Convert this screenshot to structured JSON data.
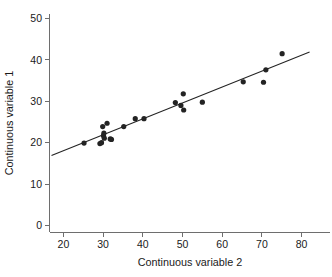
{
  "chart_data": {
    "type": "scatter",
    "title": "",
    "subtitle": "",
    "xlabel": "Continuous variable 2",
    "ylabel": "Continuous variable 1",
    "xlim": [
      16.5,
      82.5
    ],
    "ylim": [
      -1.5,
      53.0
    ],
    "xticks": [
      20,
      30,
      40,
      50,
      60,
      70,
      80
    ],
    "xticklabels": [
      "20",
      "30",
      "40",
      "50",
      "60",
      "70",
      "80"
    ],
    "yticks": [
      0,
      10,
      20,
      30,
      40,
      50
    ],
    "yticklabels": [
      "0",
      "10",
      "20",
      "30",
      "40",
      "50"
    ],
    "grid": false,
    "legend": null,
    "legend_position": "none",
    "marker": "filled-circle",
    "marker_color": "#232323",
    "marker_size": 2.6,
    "points": [
      {
        "x": 25.2,
        "y": 19.9
      },
      {
        "x": 29.2,
        "y": 19.8
      },
      {
        "x": 29.6,
        "y": 20.0
      },
      {
        "x": 29.9,
        "y": 23.9
      },
      {
        "x": 30.1,
        "y": 21.7
      },
      {
        "x": 30.2,
        "y": 22.3
      },
      {
        "x": 30.3,
        "y": 21.1
      },
      {
        "x": 31.0,
        "y": 24.7
      },
      {
        "x": 31.8,
        "y": 20.9
      },
      {
        "x": 32.1,
        "y": 20.8
      },
      {
        "x": 35.2,
        "y": 23.9
      },
      {
        "x": 38.1,
        "y": 25.8
      },
      {
        "x": 40.3,
        "y": 25.8
      },
      {
        "x": 48.2,
        "y": 29.7
      },
      {
        "x": 49.6,
        "y": 29.0
      },
      {
        "x": 50.2,
        "y": 31.8
      },
      {
        "x": 50.3,
        "y": 27.9
      },
      {
        "x": 55.0,
        "y": 29.8
      },
      {
        "x": 65.3,
        "y": 34.7
      },
      {
        "x": 70.4,
        "y": 34.6
      },
      {
        "x": 71.0,
        "y": 37.6
      },
      {
        "x": 75.1,
        "y": 41.5
      }
    ],
    "fit_line": {
      "name": "linear-regression-line",
      "x_start": 17.0,
      "y_start": 16.9,
      "x_end": 82.0,
      "y_end": 41.9,
      "slope": 0.3846,
      "intercept": 10.36
    },
    "axes_style": {
      "spines": [
        "left",
        "bottom"
      ],
      "axis_color": "#6e6e6e",
      "tick_direction": "out"
    }
  }
}
